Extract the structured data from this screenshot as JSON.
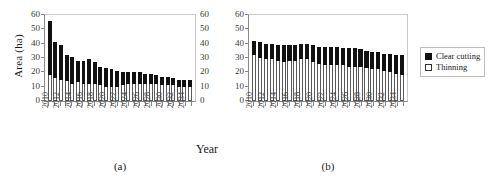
{
  "figure": {
    "ylabel": "Area (ha)",
    "xlabel": "Year",
    "legend": {
      "position": "right",
      "items": [
        {
          "label": "Clear cutting",
          "color": "#111111",
          "style": "filled"
        },
        {
          "label": "Thinning",
          "color": "#ffffff",
          "style": "outlined"
        }
      ]
    },
    "captions": {
      "a": "(a)",
      "b": "(b)"
    }
  },
  "chart_data": [
    {
      "id": "a",
      "type": "bar",
      "stacked": true,
      "title": "(a)",
      "xlabel": "Year",
      "ylabel": "Area (ha)",
      "ylim": [
        0,
        60
      ],
      "yticks": [
        0,
        10,
        20,
        30,
        40,
        50,
        60
      ],
      "grid": false,
      "legend_position": "right",
      "categories": [
        2010,
        2011,
        2012,
        2013,
        2014,
        2015,
        2016,
        2017,
        2018,
        2019,
        2020,
        2021,
        2022,
        2023,
        2024,
        2025,
        2026,
        2027,
        2028,
        2029,
        2030,
        2031,
        2032,
        2033,
        2034,
        2035
      ],
      "tick_labels": [
        "2010",
        "",
        "2012",
        "",
        "2014",
        "",
        "2016",
        "",
        "2018",
        "",
        "2020",
        "",
        "2022",
        "",
        "2024",
        "",
        "2026",
        "",
        "2028",
        "",
        "2030",
        "",
        "2032",
        "",
        "2034",
        ""
      ],
      "series": [
        {
          "name": "Thinning",
          "color": "#ffffff",
          "values": [
            18,
            16,
            15,
            14,
            12,
            13,
            12,
            12,
            12,
            11,
            10,
            10,
            10,
            11,
            12,
            12,
            12,
            12,
            12,
            12,
            11,
            11,
            11,
            10,
            10,
            10
          ]
        },
        {
          "name": "Clear cutting",
          "color": "#111111",
          "values": [
            38,
            25,
            24,
            18,
            19,
            15,
            16,
            17,
            15,
            13,
            13,
            12,
            11,
            9,
            8,
            8,
            8,
            7,
            7,
            6,
            6,
            6,
            5,
            5,
            5,
            5
          ]
        }
      ],
      "totals": [
        56,
        41,
        39,
        32,
        31,
        28,
        28,
        29,
        27,
        24,
        23,
        22,
        21,
        20,
        20,
        20,
        20,
        19,
        19,
        18,
        17,
        17,
        16,
        15,
        15,
        15
      ]
    },
    {
      "id": "b",
      "type": "bar",
      "stacked": true,
      "title": "(b)",
      "xlabel": "Year",
      "ylabel": "Area (ha)",
      "ylim": [
        0,
        60
      ],
      "yticks": [
        0,
        10,
        20,
        30,
        40,
        50,
        60
      ],
      "grid": false,
      "legend_position": "right",
      "categories": [
        2010,
        2011,
        2012,
        2013,
        2014,
        2015,
        2016,
        2017,
        2018,
        2019,
        2020,
        2021,
        2022,
        2023,
        2024,
        2025,
        2026,
        2027,
        2028,
        2029,
        2030,
        2031,
        2032,
        2033,
        2034,
        2035
      ],
      "tick_labels": [
        "2010",
        "",
        "2012",
        "",
        "2014",
        "",
        "2016",
        "",
        "2018",
        "",
        "2020",
        "",
        "2022",
        "",
        "2024",
        "",
        "2026",
        "",
        "2028",
        "",
        "2030",
        "",
        "2032",
        "",
        "2034",
        ""
      ],
      "series": [
        {
          "name": "Thinning",
          "color": "#ffffff",
          "values": [
            32,
            30,
            29,
            29,
            28,
            27,
            28,
            28,
            29,
            29,
            27,
            26,
            25,
            25,
            25,
            25,
            24,
            24,
            24,
            23,
            22,
            22,
            21,
            20,
            19,
            18
          ]
        },
        {
          "name": "Clear cutting",
          "color": "#111111",
          "values": [
            10,
            11,
            11,
            11,
            11,
            12,
            11,
            11,
            11,
            11,
            12,
            12,
            13,
            13,
            13,
            12,
            13,
            13,
            12,
            12,
            12,
            12,
            12,
            13,
            13,
            14
          ]
        }
      ],
      "totals": [
        42,
        41,
        40,
        40,
        39,
        39,
        39,
        39,
        40,
        40,
        39,
        38,
        38,
        38,
        38,
        37,
        37,
        37,
        36,
        35,
        34,
        34,
        33,
        33,
        32,
        32
      ]
    }
  ]
}
